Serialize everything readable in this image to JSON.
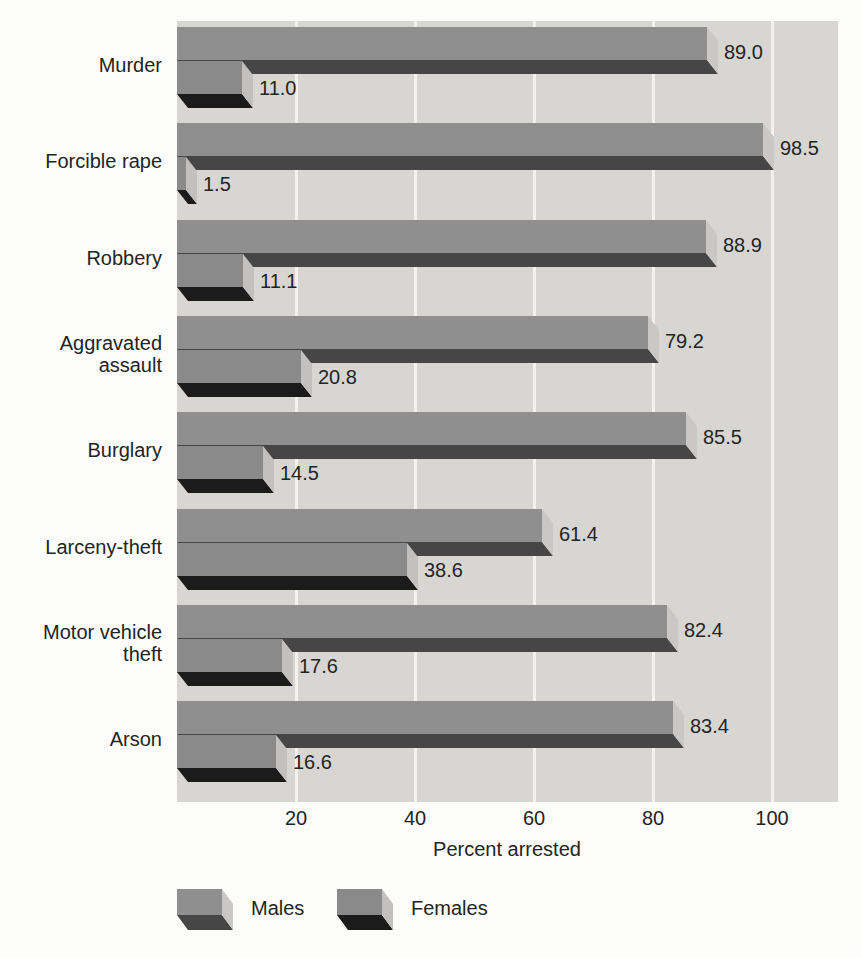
{
  "chart_data": {
    "type": "bar",
    "orientation": "horizontal",
    "bar_style": "3d",
    "categories": [
      "Murder",
      "Forcible rape",
      "Robbery",
      "Aggravated assault",
      "Burglary",
      "Larceny-theft",
      "Motor vehicle theft",
      "Arson"
    ],
    "series": [
      {
        "name": "Males",
        "values": [
          89.0,
          98.5,
          88.9,
          79.2,
          85.5,
          61.4,
          82.4,
          83.4
        ]
      },
      {
        "name": "Females",
        "values": [
          11.0,
          1.5,
          11.1,
          20.8,
          14.5,
          38.6,
          17.6,
          16.6
        ]
      }
    ],
    "value_label_format": "one_decimal",
    "xlabel": "Percent arrested",
    "xticks": [
      20,
      40,
      60,
      80,
      100
    ],
    "xlim": [
      0,
      111
    ],
    "grid": true,
    "legend_position": "bottom"
  },
  "legend": {
    "items": [
      "Males",
      "Females"
    ]
  },
  "colors": {
    "page_background": "#fcfcfb",
    "plot_background": "#d7d6d3",
    "gridline": "#f2f1ee",
    "text": "#242424",
    "males_front": "#8f8f8f",
    "males_bottom": "#464646",
    "males_cap": "#c9c8c6",
    "females_front": "#8a8a8a",
    "females_bottom": "#1b1b1b",
    "females_cap": "#c2c1bf"
  }
}
